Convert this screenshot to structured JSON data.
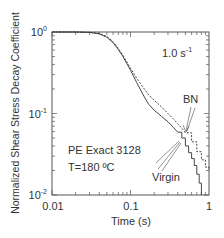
{
  "chart_data": {
    "type": "line",
    "title": "",
    "xlabel": "Time (s)",
    "ylabel": "Normalized Shear Stress Decay Coefficient",
    "xscale": "log",
    "yscale": "log",
    "xlim": [
      0.01,
      1
    ],
    "ylim": [
      0.01,
      1
    ],
    "x_ticks": [
      "0.01",
      "0.1",
      "1"
    ],
    "y_ticks": [
      {
        "base": "10",
        "exp": "0"
      },
      {
        "base": "10",
        "exp": "-1"
      },
      {
        "base": "10",
        "exp": "-2"
      }
    ],
    "grid": false,
    "legend": "annotations",
    "annotations": {
      "rate_base": "1.0 s",
      "rate_exp": "-1",
      "material": "PE Exact 3128",
      "temperature": "T=180 ºC",
      "bn_label": "BN",
      "virgin_label": "Virgin"
    },
    "series": [
      {
        "name": "Virgin",
        "style": "solid",
        "x": [
          0.01,
          0.02,
          0.03,
          0.04,
          0.05,
          0.06,
          0.07,
          0.08,
          0.1,
          0.12,
          0.15,
          0.17,
          0.2,
          0.25,
          0.3,
          0.35,
          0.4,
          0.45,
          0.5,
          0.55,
          0.6,
          0.65,
          0.7,
          0.75,
          0.8
        ],
        "values": [
          1.0,
          1.0,
          0.99,
          0.95,
          0.86,
          0.74,
          0.61,
          0.5,
          0.34,
          0.24,
          0.16,
          0.13,
          0.11,
          0.092,
          0.079,
          0.068,
          0.059,
          0.05,
          0.04,
          0.033,
          0.028,
          0.023,
          0.018,
          0.014,
          0.01
        ]
      },
      {
        "name": "BN",
        "style": "dashed",
        "x": [
          0.01,
          0.02,
          0.03,
          0.04,
          0.05,
          0.06,
          0.07,
          0.08,
          0.1,
          0.12,
          0.15,
          0.17,
          0.2,
          0.25,
          0.3,
          0.35,
          0.4,
          0.45,
          0.5,
          0.6,
          0.7,
          0.8,
          0.9,
          1.0
        ],
        "values": [
          1.0,
          1.0,
          0.99,
          0.96,
          0.88,
          0.76,
          0.63,
          0.52,
          0.36,
          0.27,
          0.2,
          0.17,
          0.145,
          0.12,
          0.1,
          0.086,
          0.075,
          0.066,
          0.058,
          0.045,
          0.034,
          0.027,
          0.022,
          0.02
        ]
      }
    ]
  }
}
